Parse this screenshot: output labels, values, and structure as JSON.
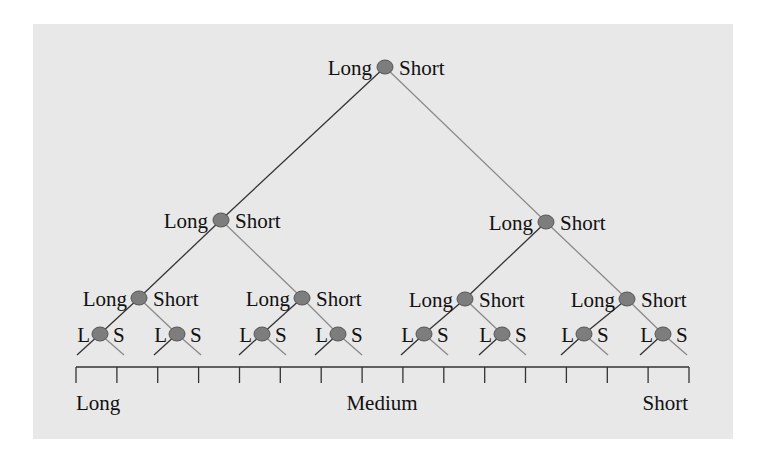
{
  "diagram": {
    "type": "binary-tree",
    "background": "#e8e8e8",
    "node_color": "#7d7d7d",
    "left_branch_color": "#333333",
    "right_branch_color": "#8a8a8a",
    "levels": [
      {
        "level": 1,
        "nodes": [
          {
            "left": "Long",
            "right": "Short"
          }
        ]
      },
      {
        "level": 2,
        "nodes": [
          {
            "left": "Long",
            "right": "Short"
          },
          {
            "left": "Long",
            "right": "Short"
          }
        ]
      },
      {
        "level": 3,
        "nodes": [
          {
            "left": "Long",
            "right": "Short"
          },
          {
            "left": "Long",
            "right": "Short"
          },
          {
            "left": "Long",
            "right": "Short"
          },
          {
            "left": "Long",
            "right": "Short"
          }
        ]
      },
      {
        "level": 4,
        "nodes": [
          {
            "left": "L",
            "right": "S"
          },
          {
            "left": "L",
            "right": "S"
          },
          {
            "left": "L",
            "right": "S"
          },
          {
            "left": "L",
            "right": "S"
          },
          {
            "left": "L",
            "right": "S"
          },
          {
            "left": "L",
            "right": "S"
          },
          {
            "left": "L",
            "right": "S"
          },
          {
            "left": "L",
            "right": "S"
          }
        ]
      }
    ],
    "axis": {
      "tick_count": 16,
      "labels": {
        "left": "Long",
        "center": "Medium",
        "right": "Short"
      }
    }
  }
}
